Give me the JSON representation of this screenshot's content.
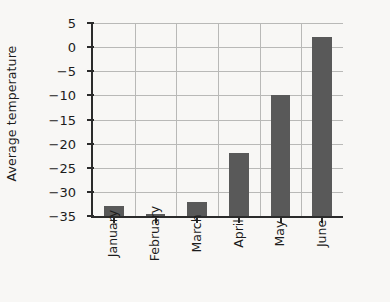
{
  "chart_data": {
    "type": "bar",
    "title": "",
    "xlabel": "",
    "ylabel": "Average temperature",
    "categories": [
      "January",
      "February",
      "March",
      "April",
      "May",
      "June"
    ],
    "values": [
      -33,
      -34.5,
      -32,
      -22,
      -10,
      2
    ],
    "ylim": [
      -35,
      5
    ],
    "ytick_labels": [
      "5",
      "0",
      "−5",
      "−10",
      "−15",
      "−20",
      "−25",
      "−30",
      "−35"
    ],
    "ytick_values": [
      5,
      0,
      -5,
      -10,
      -15,
      -20,
      -25,
      -30,
      -35
    ],
    "grid": "horizontal-and-vertical",
    "legend": "none",
    "bar_color": "#595959",
    "background_color": "#f8f7f5",
    "grid_color": "#b9b9b7",
    "axis_color": "#2b2b2b"
  }
}
